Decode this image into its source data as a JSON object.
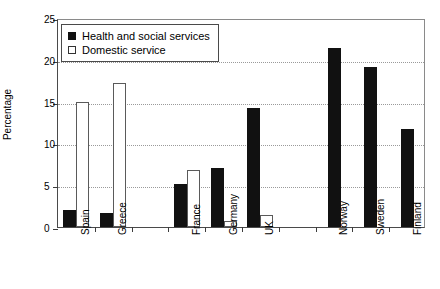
{
  "chart_data": {
    "type": "bar",
    "title": "",
    "xlabel": "",
    "ylabel": "Percentage",
    "ylim": [
      0,
      25
    ],
    "yticks": [
      0,
      5,
      10,
      15,
      20,
      25
    ],
    "grid": true,
    "legend_position": "top-left",
    "categories": [
      "Spain",
      "Greece",
      "",
      "France",
      "Germany",
      "UK",
      "",
      "Norway",
      "Sweden",
      "Finland"
    ],
    "series": [
      {
        "name": "Health and social services",
        "style": "filled",
        "color": "#111111",
        "values": [
          2.0,
          1.7,
          null,
          5.2,
          7.1,
          14.2,
          null,
          21.4,
          19.2,
          11.7
        ]
      },
      {
        "name": "Domestic service",
        "style": "open",
        "color": "#ffffff",
        "values": [
          14.9,
          17.2,
          null,
          6.8,
          0.7,
          1.4,
          null,
          null,
          null,
          null
        ]
      }
    ]
  },
  "legend": {
    "items": [
      {
        "label": "Health and social services",
        "style": "filled"
      },
      {
        "label": "Domestic service",
        "style": "open"
      }
    ]
  },
  "colors": {
    "filled": "#111111",
    "open": "#ffffff",
    "axis": "#3c3c3c",
    "grid": "#9a9a9a",
    "background": "#ffffff"
  }
}
